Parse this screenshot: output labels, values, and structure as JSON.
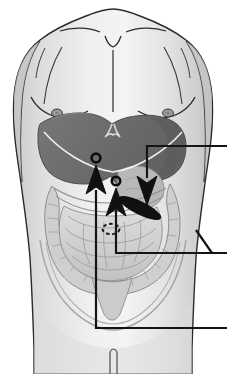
{
  "figure": {
    "title": "Anterior abdominal anatomy with organ landmark pointers",
    "background_color": "#ffffff",
    "width": 227,
    "height": 374
  },
  "palette": {
    "skin_light": "#ececec",
    "skin_mid": "#dcdcdc",
    "skin_shadow": "#c8c8c8",
    "skin_edge": "#bdbdbd",
    "outline": "#2b2b2b",
    "liver": "#6f6f6f",
    "liver_dark": "#5d5d5d",
    "liver_edge": "#4a4a4a",
    "stomach": "#b8b8b8",
    "bowel_light": "#d6d6d6",
    "bowel_mid": "#c4c4c4",
    "bowel_line": "#8c8c8c",
    "colon": "#cfcfcf",
    "marker_black": "#101010",
    "nipple": "#9a9a9a",
    "leader_line": "#151515"
  },
  "body_parts": [
    {
      "name": "torso",
      "label": "Torso"
    },
    {
      "name": "shoulders",
      "label": "Shoulders"
    },
    {
      "name": "clavicle-left",
      "label": "Left clavicle"
    },
    {
      "name": "clavicle-right",
      "label": "Right clavicle"
    },
    {
      "name": "sternum-line",
      "label": "Sternum midline"
    },
    {
      "name": "suprasternal-notch",
      "label": "Suprasternal notch"
    },
    {
      "name": "breast-left",
      "label": "Left breast contour"
    },
    {
      "name": "breast-right",
      "label": "Right breast contour"
    },
    {
      "name": "nipple-left",
      "label": "Left nipple"
    },
    {
      "name": "nipple-right",
      "label": "Right nipple"
    },
    {
      "name": "costal-margin",
      "label": "Costal margin"
    },
    {
      "name": "pelvis-brim",
      "label": "Pelvic brim"
    },
    {
      "name": "umbilicus",
      "label": "Umbilicus"
    },
    {
      "name": "pubic-cleft",
      "label": "Pubic cleft"
    }
  ],
  "organs": [
    {
      "name": "liver",
      "label": "Liver",
      "color": "#6f6f6f"
    },
    {
      "name": "stomach",
      "label": "Stomach",
      "color": "#b8b8b8"
    },
    {
      "name": "small-intestine",
      "label": "Small intestine",
      "color": "#d6d6d6"
    },
    {
      "name": "large-intestine",
      "label": "Large intestine / colon",
      "color": "#cfcfcf"
    },
    {
      "name": "spleen-marker",
      "label": "Dark elongated organ marker",
      "color": "#101010"
    }
  ],
  "markers": [
    {
      "name": "marker-ring-left",
      "label": "Left landmark ring",
      "shape": "open-circle",
      "x": 96,
      "y": 158
    },
    {
      "name": "marker-ring-center",
      "label": "Center landmark ring",
      "shape": "open-circle",
      "x": 116,
      "y": 181
    },
    {
      "name": "umbilicus-marker",
      "label": "Umbilicus dashed oval",
      "shape": "dashed-ellipse",
      "x": 111,
      "y": 229
    },
    {
      "name": "dark-ellipse-marker",
      "label": "Dark elongated ellipse",
      "shape": "filled-ellipse",
      "x": 140,
      "y": 208
    }
  ],
  "pointers": [
    {
      "name": "pointer-upper-left",
      "direction": "up",
      "arrow_tip": {
        "x": 96,
        "y": 168
      },
      "leader_down_to_y": 328,
      "leader_exit_x": 227,
      "label": ""
    },
    {
      "name": "pointer-center",
      "direction": "up",
      "arrow_tip": {
        "x": 116,
        "y": 190
      },
      "leader_down_to_y": 253,
      "leader_exit_x": 227,
      "label": ""
    },
    {
      "name": "pointer-right-down",
      "direction": "down",
      "arrow_tip": {
        "x": 147,
        "y": 200
      },
      "leader_up_to_y": 146,
      "leader_exit_x": 227,
      "label": ""
    }
  ],
  "leader_lines": [
    {
      "name": "leader-line-top",
      "y": 146,
      "x_start": 147,
      "x_end": 227
    },
    {
      "name": "leader-line-middle",
      "y": 253,
      "x_start": 116,
      "x_end": 227
    },
    {
      "name": "leader-line-bottom",
      "y": 328,
      "x_start": 96,
      "x_end": 227
    }
  ],
  "labels": {
    "top_label": "",
    "middle_label": "",
    "bottom_label": ""
  }
}
